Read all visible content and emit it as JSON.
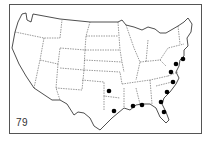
{
  "map": {
    "type": "US state outline map",
    "figure_number": "79",
    "line_color": "#222222",
    "dot_color": "#000000",
    "markers": [
      {
        "state": "New Jersey",
        "x": 183,
        "y": 59
      },
      {
        "state": "Maryland/Delaware",
        "x": 176,
        "y": 64
      },
      {
        "state": "Virginia",
        "x": 171,
        "y": 72
      },
      {
        "state": "North Carolina",
        "x": 173,
        "y": 82
      },
      {
        "state": "South Carolina",
        "x": 167,
        "y": 92
      },
      {
        "state": "Georgia",
        "x": 161,
        "y": 102
      },
      {
        "state": "Florida",
        "x": 164,
        "y": 112
      },
      {
        "state": "Alabama",
        "x": 142,
        "y": 105
      },
      {
        "state": "Mississippi",
        "x": 133,
        "y": 106
      },
      {
        "state": "Arkansas",
        "x": 109,
        "y": 91
      },
      {
        "state": "Louisiana",
        "x": 114,
        "y": 111
      }
    ]
  }
}
